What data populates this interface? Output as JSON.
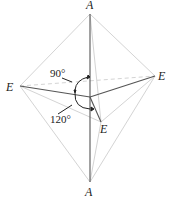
{
  "diagram": {
    "title": "",
    "labels": {
      "top_apex": "A",
      "bottom_apex": "A",
      "left_equatorial": "E",
      "right_equatorial": "E",
      "front_equatorial": "E"
    },
    "angles": {
      "axial_equatorial": "90°",
      "equatorial_equatorial": "120°"
    },
    "colors": {
      "bond": "#555555",
      "edge": "#cfcfcf",
      "text": "#222222"
    }
  }
}
